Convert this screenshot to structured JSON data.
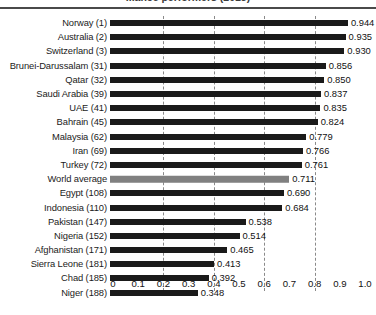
{
  "chart": {
    "title": "...ance performers (2015)",
    "title_note": "top edge of title is cropped off in the source image"
  },
  "chart_data": {
    "type": "bar",
    "orientation": "horizontal",
    "title": "...ance performers (2015)",
    "xlabel": "",
    "ylabel": "",
    "xlim": [
      0,
      1.0
    ],
    "grid": true,
    "gridlines": [
      0.2,
      0.4,
      0.6,
      0.8
    ],
    "legend": "none",
    "tick_labels": [
      "0",
      "0.1",
      "0.2",
      "0.3",
      "0.4",
      "0.5",
      "0.6",
      "0.7",
      "0.8",
      "0.9",
      "1.0"
    ],
    "ticks": [
      0,
      0.1,
      0.2,
      0.3,
      0.4,
      0.5,
      0.6,
      0.7,
      0.8,
      0.9,
      1.0
    ],
    "categories": [
      "Norway (1)",
      "Australia (2)",
      "Switzerland (3)",
      "Brunei-Darussalam (31)",
      "Qatar (32)",
      "Saudi Arabia (39)",
      "UAE (41)",
      "Bahrain (45)",
      "Malaysia (62)",
      "Iran (69)",
      "Turkey (72)",
      "World average",
      "Egypt (108)",
      "Indonesia (110)",
      "Pakistan (147)",
      "Nigeria (152)",
      "Afghanistan (171)",
      "Sierra Leone (181)",
      "Chad (185)",
      "Niger (188)"
    ],
    "values": [
      0.944,
      0.935,
      0.93,
      0.856,
      0.85,
      0.837,
      0.835,
      0.824,
      0.779,
      0.766,
      0.761,
      0.711,
      0.69,
      0.684,
      0.538,
      0.514,
      0.465,
      0.413,
      0.392,
      0.348
    ],
    "value_labels": [
      "0.944",
      "0.935",
      "0.930",
      "0.856",
      "0.850",
      "0.837",
      "0.835",
      "0.824",
      "0.779",
      "0.766",
      "0.761",
      "0.711",
      "0.690",
      "0.684",
      "0.538",
      "0.514",
      "0.465",
      "0.413",
      "0.392",
      "0.348"
    ],
    "highlight_index": 11,
    "colors": {
      "bar": "#1a1a1a",
      "highlight_bar": "#808080",
      "gridline": "#8a8a8a",
      "rule": "#4a4a4a",
      "text": "#111111"
    }
  }
}
